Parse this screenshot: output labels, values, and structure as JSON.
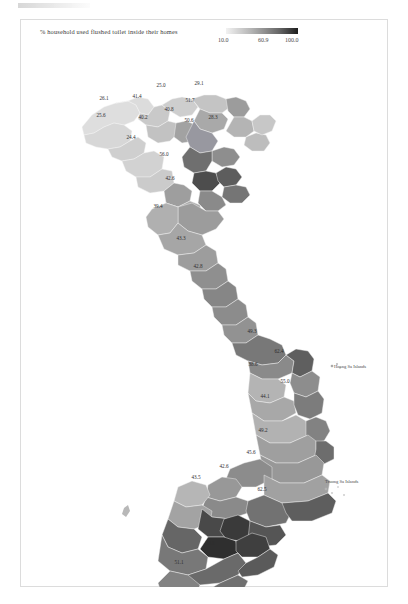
{
  "figure": {
    "legend_title": "% household used flushed toilet inside their homes",
    "tick_low": "10.0",
    "tick_mid": "60.9",
    "tick_high": "100.0"
  },
  "annotations": {
    "hoang_sa": "Hoang Sa Islands",
    "truong_sa": "Truong Sa Islands"
  },
  "chart_data": {
    "type": "heatmap",
    "title": "% household used flushed toilet inside their homes",
    "subtitle": "",
    "xlabel": "",
    "ylabel": "",
    "legend_position": "top-right",
    "grid": false,
    "colorbar": {
      "ticks": [
        10.0,
        60.9,
        100.0
      ],
      "tick_labels": [
        "10.0",
        "60.9",
        "100.0"
      ],
      "vmin": 10.0,
      "vmax": 100.0,
      "colormap": "greys-light-to-dark"
    },
    "geography": "Vietnam provinces (choropleth)",
    "unit": "percent",
    "regions": [
      {
        "label": "26.1",
        "value": 26.1,
        "x": 104,
        "y": 100
      },
      {
        "label": "41.4",
        "value": 41.4,
        "x": 137,
        "y": 98
      },
      {
        "label": "25.6",
        "value": 25.6,
        "x": 101,
        "y": 117
      },
      {
        "label": "25.0",
        "value": 25.0,
        "x": 161,
        "y": 87
      },
      {
        "label": "29.1",
        "value": 29.1,
        "x": 199,
        "y": 85
      },
      {
        "label": "51.7",
        "value": 51.7,
        "x": 190,
        "y": 102
      },
      {
        "label": "40.8",
        "value": 40.8,
        "x": 169,
        "y": 111
      },
      {
        "label": "40.2",
        "value": 40.2,
        "x": 143,
        "y": 119
      },
      {
        "label": "50.6",
        "value": 50.6,
        "x": 189,
        "y": 122
      },
      {
        "label": "28.3",
        "value": 28.3,
        "x": 213,
        "y": 119
      },
      {
        "label": "24.4",
        "value": 24.4,
        "x": 131,
        "y": 139
      },
      {
        "label": "56.0",
        "value": 56.0,
        "x": 164,
        "y": 156
      },
      {
        "label": "42.6",
        "value": 42.6,
        "x": 170,
        "y": 180
      },
      {
        "label": "39.4",
        "value": 39.4,
        "x": 158,
        "y": 208
      },
      {
        "label": "43.3",
        "value": 43.3,
        "x": 181,
        "y": 240
      },
      {
        "label": "42.8",
        "value": 42.8,
        "x": 198,
        "y": 268
      },
      {
        "label": "49.3",
        "value": 49.3,
        "x": 252,
        "y": 333
      },
      {
        "label": "62.4",
        "value": 62.4,
        "x": 279,
        "y": 353
      },
      {
        "label": "38.6",
        "value": 38.6,
        "x": 253,
        "y": 366
      },
      {
        "label": "55.0",
        "value": 55.0,
        "x": 285,
        "y": 383
      },
      {
        "label": "44.1",
        "value": 44.1,
        "x": 265,
        "y": 398
      },
      {
        "label": "49.2",
        "value": 49.2,
        "x": 263,
        "y": 432
      },
      {
        "label": "45.6",
        "value": 45.6,
        "x": 251,
        "y": 454
      },
      {
        "label": "42.6",
        "value": 42.6,
        "x": 224,
        "y": 468
      },
      {
        "label": "43.5",
        "value": 43.5,
        "x": 196,
        "y": 479
      },
      {
        "label": "62.5",
        "value": 62.5,
        "x": 262,
        "y": 491
      },
      {
        "label": "54.1",
        "value": 54.1,
        "x": 210,
        "y": 545
      },
      {
        "label": "51.1",
        "value": 51.1,
        "x": 179,
        "y": 564
      }
    ]
  }
}
